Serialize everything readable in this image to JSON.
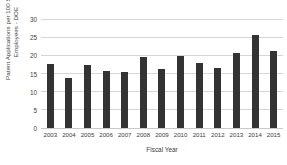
{
  "chart_data": {
    "type": "bar",
    "title": "",
    "xlabel": "Fiscal Year",
    "ylabel": "Patent Applications per 100 STEM Employees - DOE",
    "ylabel_lines": [
      "Patent Applications per 100 STEM",
      "Employees - DOE"
    ],
    "categories": [
      "2003",
      "2004",
      "2005",
      "2006",
      "2007",
      "2008",
      "2009",
      "2010",
      "2011",
      "2012",
      "2013",
      "2014",
      "2015"
    ],
    "values": [
      17.7,
      13.9,
      17.4,
      15.8,
      15.3,
      19.6,
      16.2,
      19.7,
      18.0,
      16.6,
      20.6,
      25.7,
      21.3
    ],
    "ylim": [
      0,
      30
    ],
    "ytick_labels": [
      "0",
      "5",
      "10",
      "15",
      "20",
      "25",
      "30"
    ],
    "ytick_values": [
      0,
      5,
      10,
      15,
      20,
      25,
      30
    ],
    "grid": true,
    "legend": false,
    "bar_color": "#333333",
    "grid_color": "#d6d6d6",
    "background_color": "#ffffff"
  }
}
